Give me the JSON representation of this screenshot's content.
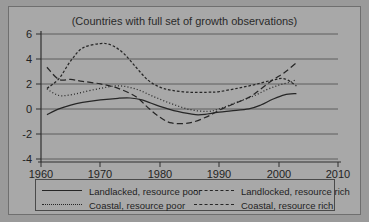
{
  "chart_data": {
    "type": "line",
    "title": "(Countries with full set of growth observations)",
    "xlabel": "",
    "ylabel": "",
    "xlim": [
      1960,
      2010
    ],
    "ylim": [
      -4,
      6
    ],
    "xticks": [
      1960,
      1970,
      1980,
      1990,
      2000,
      2010
    ],
    "yticks": [
      6,
      4,
      2,
      0,
      -2,
      -4
    ],
    "grid": true,
    "legend_position": "bottom",
    "series": [
      {
        "name": "Landlacked, resource poor",
        "style": "solid",
        "x": [
          1961,
          1963,
          1965,
          1967,
          1970,
          1973,
          1975,
          1977,
          1980,
          1983,
          1986,
          1988,
          1990,
          1992,
          1995,
          1997,
          1999,
          2001,
          2003
        ],
        "values": [
          -0.3,
          0.15,
          0.45,
          0.65,
          0.85,
          0.98,
          1.0,
          0.85,
          0.35,
          -0.05,
          -0.3,
          -0.25,
          -0.1,
          0.0,
          0.15,
          0.45,
          0.9,
          1.25,
          1.35
        ]
      },
      {
        "name": "Coastal, resource poor",
        "style": "dotted",
        "x": [
          1961,
          1963,
          1965,
          1967,
          1970,
          1973,
          1976,
          1979,
          1982,
          1985,
          1988,
          1990,
          1992,
          1994,
          1996,
          1998,
          2000,
          2002,
          2003
        ],
        "values": [
          1.7,
          1.2,
          1.25,
          1.45,
          1.75,
          1.95,
          1.7,
          1.1,
          0.55,
          0.1,
          -0.05,
          0.15,
          0.5,
          0.85,
          1.2,
          1.65,
          2.0,
          2.25,
          2.45
        ]
      },
      {
        "name": "Landlocked, resource rich",
        "style": "fine-dashed",
        "x": [
          1961,
          1963,
          1965,
          1967,
          1970,
          1972,
          1974,
          1976,
          1978,
          1980,
          1982,
          1985,
          1988,
          1990,
          1993,
          1996,
          1999,
          2001,
          2003
        ],
        "values": [
          1.75,
          2.5,
          3.9,
          4.9,
          5.25,
          5.1,
          4.45,
          3.4,
          2.4,
          1.85,
          1.6,
          1.45,
          1.45,
          1.5,
          1.75,
          2.05,
          2.4,
          2.5,
          1.95
        ]
      },
      {
        "name": "Coastal, resource rich",
        "style": "dashed",
        "x": [
          1961,
          1963,
          1965,
          1967,
          1970,
          1973,
          1976,
          1978,
          1980,
          1982,
          1985,
          1988,
          1990,
          1992,
          1995,
          1997,
          1999,
          2001,
          2003
        ],
        "values": [
          3.4,
          2.45,
          2.45,
          2.3,
          2.1,
          1.75,
          1.1,
          0.25,
          -0.5,
          -0.95,
          -0.95,
          -0.45,
          0.05,
          0.45,
          1.05,
          1.7,
          2.4,
          3.0,
          3.75
        ]
      }
    ]
  },
  "legend": {
    "entries": [
      {
        "label": "Landlacked, resource poor",
        "style": "solid"
      },
      {
        "label": "Landlocked, resource rich",
        "style": "fine-dashed"
      },
      {
        "label": "Coastal, resource poor",
        "style": "dotted"
      },
      {
        "label": "Coastal, resource rich",
        "style": "dashed"
      }
    ]
  },
  "colors": {
    "page_background": "#9a9a9a",
    "panel_background": "#a8a8a8",
    "line": "#262626",
    "axis": "#3a3a3a",
    "grid": "#555555",
    "text": "#232323"
  }
}
